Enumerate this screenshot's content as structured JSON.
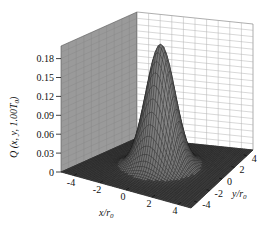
{
  "chart_data": {
    "type": "surface3d",
    "title": "",
    "function": "2D Gaussian-like peak centered at (0,0)",
    "xlabel": "x/r0",
    "ylabel": "y/r0",
    "zlabel": "Q (x, y, 1.00T0)",
    "xlim": [
      -5,
      5
    ],
    "ylim": [
      -5,
      5
    ],
    "zlim": [
      0,
      0.2
    ],
    "x_ticks": [
      "-4",
      "-2",
      "0",
      "2",
      "4"
    ],
    "y_ticks": [
      "-4",
      "-2",
      "0",
      "2",
      "4"
    ],
    "z_ticks": [
      "0",
      "0.03",
      "0.06",
      "0.09",
      "0.12",
      "0.15",
      "0.18"
    ],
    "peak": {
      "x": 0,
      "y": 0,
      "z": 0.195
    },
    "grid": true,
    "legend": null,
    "colors": {
      "left_wall": "#9a9a9a",
      "right_wall": "#ffffff",
      "grid_lines": "#b0b0b0",
      "surface_dark": "#2a2a2a",
      "surface_light": "#9c9c9c"
    }
  },
  "labels": {
    "z_axis": "Q (x, y, 1.00T",
    "z_axis_sub": "0",
    "z_axis_close": ")",
    "x_axis": "x/r",
    "x_axis_sub": "0",
    "y_axis": "y/r",
    "y_axis_sub": "0"
  }
}
